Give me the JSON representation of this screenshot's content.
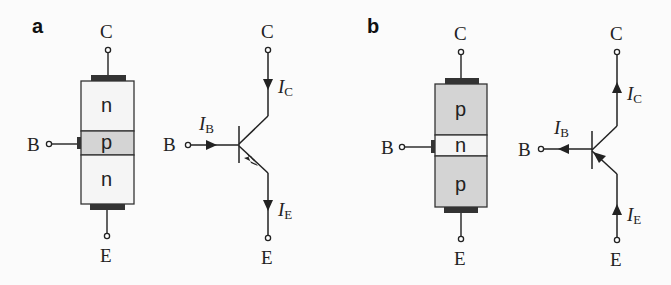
{
  "figure": {
    "panels": [
      {
        "label": "a",
        "type": "npn",
        "device": {
          "regions": [
            {
              "name": "collector",
              "doping": "n",
              "fill": "#f5f5f5"
            },
            {
              "name": "base",
              "doping": "p",
              "fill": "#d4d4d4"
            },
            {
              "name": "emitter",
              "doping": "n",
              "fill": "#f5f5f5"
            }
          ],
          "terminals": {
            "collector": "C",
            "base": "B",
            "emitter": "E"
          }
        },
        "schematic": {
          "terminals": {
            "collector": "C",
            "base": "B",
            "emitter": "E"
          },
          "currents": {
            "base": {
              "symbol": "I",
              "sub": "B",
              "direction": "into base"
            },
            "collector": {
              "symbol": "I",
              "sub": "C",
              "direction": "into collector"
            },
            "emitter": {
              "symbol": "I",
              "sub": "E",
              "direction": "out of emitter"
            }
          }
        }
      },
      {
        "label": "b",
        "type": "pnp",
        "device": {
          "regions": [
            {
              "name": "collector",
              "doping": "p",
              "fill": "#d4d4d4"
            },
            {
              "name": "base",
              "doping": "n",
              "fill": "#f5f5f5"
            },
            {
              "name": "emitter",
              "doping": "p",
              "fill": "#d4d4d4"
            }
          ],
          "terminals": {
            "collector": "C",
            "base": "B",
            "emitter": "E"
          }
        },
        "schematic": {
          "terminals": {
            "collector": "C",
            "base": "B",
            "emitter": "E"
          },
          "currents": {
            "base": {
              "symbol": "I",
              "sub": "B",
              "direction": "out of base"
            },
            "collector": {
              "symbol": "I",
              "sub": "C",
              "direction": "out of collector"
            },
            "emitter": {
              "symbol": "I",
              "sub": "E",
              "direction": "into emitter"
            }
          }
        }
      }
    ],
    "colors": {
      "line": "#222222",
      "contact": "#333333",
      "light": "#f5f5f5",
      "shade": "#d4d4d4"
    }
  }
}
